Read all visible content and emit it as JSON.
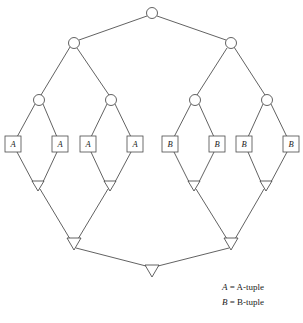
{
  "figure": {
    "type": "dag-diagram",
    "background_color": "#ffffff",
    "stroke_color": "#3a3a3a"
  },
  "nodes": {
    "circles": [
      {
        "id": "c-root",
        "label": "",
        "cx": 152,
        "cy": 13,
        "r": 5.5
      },
      {
        "id": "c-l1",
        "label": "",
        "cx": 74,
        "cy": 43,
        "r": 5.5
      },
      {
        "id": "c-r1",
        "label": "",
        "cx": 231,
        "cy": 43,
        "r": 5.5
      },
      {
        "id": "c-l2a",
        "label": "",
        "cx": 39,
        "cy": 100,
        "r": 5.5
      },
      {
        "id": "c-l2b",
        "label": "",
        "cx": 111,
        "cy": 100,
        "r": 5.5
      },
      {
        "id": "c-r2a",
        "label": "",
        "cx": 195,
        "cy": 100,
        "r": 5.5
      },
      {
        "id": "c-r2b",
        "label": "",
        "cx": 267,
        "cy": 100,
        "r": 5.5
      }
    ],
    "boxes": [
      {
        "id": "box-a1",
        "label": "A",
        "cx": 13,
        "cy": 144,
        "w": 16,
        "h": 16
      },
      {
        "id": "box-a2",
        "label": "A",
        "cx": 60,
        "cy": 144,
        "w": 16,
        "h": 16
      },
      {
        "id": "box-a3",
        "label": "A",
        "cx": 88,
        "cy": 144,
        "w": 16,
        "h": 16
      },
      {
        "id": "box-a4",
        "label": "A",
        "cx": 135,
        "cy": 144,
        "w": 16,
        "h": 16
      },
      {
        "id": "box-b1",
        "label": "B",
        "cx": 170,
        "cy": 144,
        "w": 16,
        "h": 16
      },
      {
        "id": "box-b2",
        "label": "B",
        "cx": 217,
        "cy": 144,
        "w": 16,
        "h": 16
      },
      {
        "id": "box-b3",
        "label": "B",
        "cx": 244,
        "cy": 144,
        "w": 16,
        "h": 16
      },
      {
        "id": "box-b4",
        "label": "B",
        "cx": 291,
        "cy": 144,
        "w": 16,
        "h": 16
      }
    ],
    "triangles": [
      {
        "id": "t-l3a",
        "label": "",
        "cx": 38,
        "cy_top": 181,
        "w": 12,
        "h": 10
      },
      {
        "id": "t-l3b",
        "label": "",
        "cx": 110,
        "cy_top": 181,
        "w": 12,
        "h": 10
      },
      {
        "id": "t-r3a",
        "label": "",
        "cx": 194,
        "cy_top": 181,
        "w": 12,
        "h": 10
      },
      {
        "id": "t-r3b",
        "label": "",
        "cx": 266,
        "cy_top": 181,
        "w": 12,
        "h": 10
      },
      {
        "id": "t-l4",
        "label": "",
        "cx": 74,
        "cy_top": 238,
        "w": 14,
        "h": 12
      },
      {
        "id": "t-r4",
        "label": "",
        "cx": 231,
        "cy_top": 238,
        "w": 14,
        "h": 12
      },
      {
        "id": "t-root",
        "label": "",
        "cx": 152,
        "cy_top": 265,
        "w": 14,
        "h": 12
      }
    ]
  },
  "edges": [
    {
      "from": "c-root",
      "to": "c-l1"
    },
    {
      "from": "c-root",
      "to": "c-r1"
    },
    {
      "from": "c-l1",
      "to": "c-l2a"
    },
    {
      "from": "c-l1",
      "to": "c-l2b"
    },
    {
      "from": "c-r1",
      "to": "c-r2a"
    },
    {
      "from": "c-r1",
      "to": "c-r2b"
    },
    {
      "from": "c-l2a",
      "to": "box-a1"
    },
    {
      "from": "c-l2a",
      "to": "box-a2"
    },
    {
      "from": "c-l2b",
      "to": "box-a3"
    },
    {
      "from": "c-l2b",
      "to": "box-a4"
    },
    {
      "from": "c-r2a",
      "to": "box-b1"
    },
    {
      "from": "c-r2a",
      "to": "box-b2"
    },
    {
      "from": "c-r2b",
      "to": "box-b3"
    },
    {
      "from": "c-r2b",
      "to": "box-b4"
    },
    {
      "from": "box-a1",
      "to": "t-l3a"
    },
    {
      "from": "box-a2",
      "to": "t-l3a"
    },
    {
      "from": "box-a3",
      "to": "t-l3b"
    },
    {
      "from": "box-a4",
      "to": "t-l3b"
    },
    {
      "from": "box-b1",
      "to": "t-r3a"
    },
    {
      "from": "box-b2",
      "to": "t-r3a"
    },
    {
      "from": "box-b3",
      "to": "t-r3b"
    },
    {
      "from": "box-b4",
      "to": "t-r3b"
    },
    {
      "from": "t-l3a",
      "to": "t-l4"
    },
    {
      "from": "t-l3b",
      "to": "t-l4"
    },
    {
      "from": "t-r3a",
      "to": "t-r4"
    },
    {
      "from": "t-r3b",
      "to": "t-r4"
    },
    {
      "from": "t-l4",
      "to": "t-root"
    },
    {
      "from": "t-r4",
      "to": "t-root"
    }
  ],
  "legend": {
    "rows": [
      {
        "symbol": "A",
        "equals": " = ",
        "text": "A-tuple"
      },
      {
        "symbol": "B",
        "equals": " = ",
        "text": "B-tuple"
      }
    ],
    "line_a": "A = A-tuple",
    "line_b": "B = B-tuple"
  }
}
